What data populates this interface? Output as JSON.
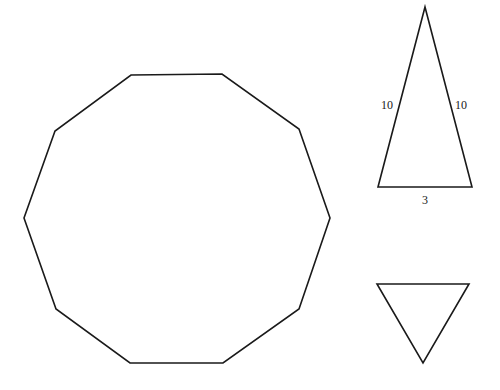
{
  "diagram": {
    "decagon": {
      "points": "131,75 222,74 299,129 330,218 299,309 223,363 130,363 56,309 24,218 55,131"
    },
    "isosceles_triangle": {
      "points": "425,7 472,187 378,187",
      "labels": {
        "left_side": "10",
        "right_side": "10",
        "base": "3"
      }
    },
    "inverted_triangle": {
      "points": "377,284 469,284 423,363"
    },
    "colors": {
      "stroke": "#1a1a1a",
      "background": "#ffffff"
    }
  }
}
